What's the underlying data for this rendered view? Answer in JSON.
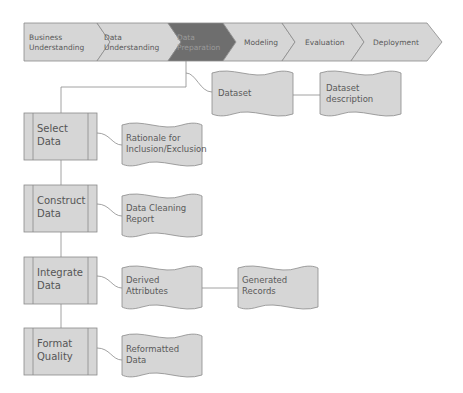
{
  "phases": [
    {
      "label_line1": "Business",
      "label_line2": "Understanding",
      "active": false
    },
    {
      "label_line1": "Data",
      "label_line2": "Understanding",
      "active": false
    },
    {
      "label_line1": "Data",
      "label_line2": "Preparation",
      "active": true
    },
    {
      "label_line1": "Modeling",
      "label_line2": "",
      "active": false
    },
    {
      "label_line1": "Evaluation",
      "label_line2": "",
      "active": false
    },
    {
      "label_line1": "Deployment",
      "label_line2": "",
      "active": false
    }
  ],
  "tasks": [
    {
      "label_line1": "Select",
      "label_line2": "Data"
    },
    {
      "label_line1": "Construct",
      "label_line2": "Data"
    },
    {
      "label_line1": "Integrate",
      "label_line2": "Data"
    },
    {
      "label_line1": "Format",
      "label_line2": "Quality"
    }
  ],
  "outputs": {
    "dataset": {
      "label_line1": "Dataset",
      "label_line2": ""
    },
    "dataset_description": {
      "label_line1": "Dataset",
      "label_line2": "description"
    },
    "rationale": {
      "label_line1": "Rationale for",
      "label_line2": "Inclusion/Exclusion"
    },
    "cleaning_report": {
      "label_line1": "Data Cleaning",
      "label_line2": "Report"
    },
    "derived_attributes": {
      "label_line1": "Derived",
      "label_line2": "Attributes"
    },
    "generated_records": {
      "label_line1": "Generated",
      "label_line2": "Records"
    },
    "reformatted_data": {
      "label_line1": "Reformatted",
      "label_line2": "Data"
    }
  },
  "colors": {
    "shape_fill": "#d6d6d6",
    "shape_stroke": "#8a8a8a",
    "active_fill": "#6e6e6e",
    "line": "#8a8a8a",
    "text": "#5a5a5a"
  }
}
